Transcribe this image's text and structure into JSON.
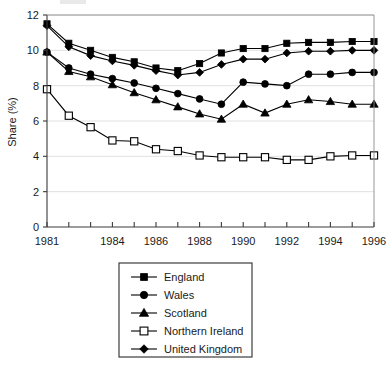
{
  "chart_data": {
    "type": "line",
    "title": "",
    "subtitle": "",
    "xlabel": "",
    "ylabel": "Share (%)",
    "x": [
      1981,
      1982,
      1983,
      1984,
      1985,
      1986,
      1987,
      1988,
      1989,
      1990,
      1991,
      1992,
      1993,
      1994,
      1995,
      1996
    ],
    "xtick_labels": [
      "1981",
      "",
      "",
      "1984",
      "",
      "1986",
      "",
      "1988",
      "",
      "1990",
      "",
      "1992",
      "",
      "1994",
      "",
      "1996"
    ],
    "xlim": [
      1981,
      1996
    ],
    "ylim": [
      0,
      12
    ],
    "ytick_labels": [
      "0",
      "2",
      "4",
      "6",
      "8",
      "10",
      "12"
    ],
    "yticks": [
      0,
      2,
      4,
      6,
      8,
      10,
      12
    ],
    "grid": "horizontal-light",
    "legend_position": "below-center",
    "series": [
      {
        "name": "England",
        "marker": "filled-square",
        "values": [
          11.5,
          10.4,
          10.0,
          9.6,
          9.35,
          9.0,
          8.85,
          9.25,
          9.85,
          10.1,
          10.1,
          10.4,
          10.45,
          10.45,
          10.5,
          10.5
        ]
      },
      {
        "name": "Wales",
        "marker": "filled-circle",
        "values": [
          9.9,
          9.0,
          8.65,
          8.4,
          8.15,
          7.85,
          7.55,
          7.25,
          6.95,
          8.2,
          8.1,
          8.0,
          8.65,
          8.65,
          8.75,
          8.75
        ]
      },
      {
        "name": "Scotland",
        "marker": "filled-triangle",
        "values": [
          9.9,
          8.8,
          8.5,
          8.05,
          7.6,
          7.2,
          6.8,
          6.4,
          6.1,
          6.95,
          6.45,
          6.95,
          7.2,
          7.1,
          6.95,
          6.95
        ]
      },
      {
        "name": "Northern Ireland",
        "marker": "open-square",
        "values": [
          7.8,
          6.3,
          5.65,
          4.9,
          4.85,
          4.4,
          4.3,
          4.05,
          3.95,
          3.95,
          3.95,
          3.8,
          3.8,
          4.0,
          4.05,
          4.05
        ]
      },
      {
        "name": "United Kingdom",
        "marker": "filled-diamond",
        "values": [
          11.4,
          10.2,
          9.7,
          9.4,
          9.15,
          8.85,
          8.6,
          8.75,
          9.2,
          9.5,
          9.5,
          9.85,
          9.95,
          9.95,
          10.0,
          10.0
        ]
      }
    ]
  },
  "legend": {
    "entries": [
      {
        "label": "England",
        "marker": "filled-square"
      },
      {
        "label": "Wales",
        "marker": "filled-circle"
      },
      {
        "label": "Scotland",
        "marker": "filled-triangle"
      },
      {
        "label": "Northern Ireland",
        "marker": "open-square"
      },
      {
        "label": "United Kingdom",
        "marker": "filled-diamond"
      }
    ]
  }
}
